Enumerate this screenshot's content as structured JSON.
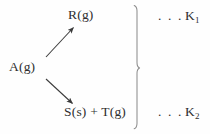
{
  "figure": {
    "type": "reaction-scheme",
    "background_color": "#fefefe",
    "ink_color": "#2f2f2f"
  },
  "species": {
    "reactant": "A(g)",
    "product_top": "R(g)",
    "product_bottom": "S(s) + T(g)"
  },
  "constants": {
    "ellipsis": ". . .",
    "top": {
      "symbol": "K",
      "subscript": "1"
    },
    "bottom": {
      "symbol": "K",
      "subscript": "2"
    }
  },
  "arrows": [
    {
      "name": "arrow-to-top-product",
      "from": "A(g)",
      "to": "R(g)",
      "x1": 46,
      "y1": 57,
      "x2": 74,
      "y2": 27
    },
    {
      "name": "arrow-to-bottom-product",
      "from": "A(g)",
      "to": "S(s) + T(g)",
      "x1": 46,
      "y1": 79,
      "x2": 73,
      "y2": 104
    }
  ],
  "brace": {
    "name": "right-curly-brace",
    "orientation": "right",
    "x": 137,
    "top": 5,
    "bottom": 129,
    "midpoint": 68
  }
}
